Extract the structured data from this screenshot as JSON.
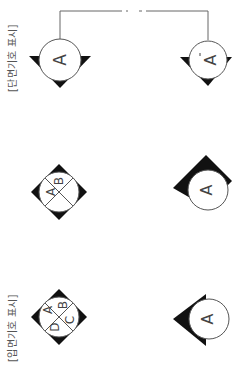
{
  "orientation": "rotated -90deg (content reads bottom-to-top)",
  "colors": {
    "line": "#555555",
    "fill": "#111111",
    "text": "#444444",
    "background": "#ffffff"
  },
  "labels": {
    "section": "[단면기호 표시]",
    "elevation": "[입면기호 표시]"
  },
  "section_symbols": [
    {
      "id": "section-start",
      "letter": "A",
      "prime": false
    },
    {
      "id": "section-end",
      "letter": "A",
      "prime": true,
      "prime_mark": "'"
    }
  ],
  "section_line": {
    "style": "solid with dashed break in middle"
  },
  "elevation_symbols": [
    {
      "id": "elev-2way",
      "letters": [
        "A",
        "B"
      ],
      "type": "diamond-split"
    },
    {
      "id": "elev-single",
      "letters": [
        "A"
      ],
      "type": "two-arrow"
    },
    {
      "id": "elev-4way",
      "letters": [
        "A",
        "B",
        "C",
        "D"
      ],
      "type": "diamond-split"
    },
    {
      "id": "elev-1way",
      "letters": [
        "A"
      ],
      "type": "single-arrow"
    }
  ]
}
